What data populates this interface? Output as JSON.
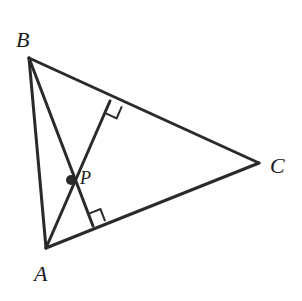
{
  "figure": {
    "type": "geometry-diagram",
    "background_color": "#ffffff",
    "stroke_color": "#2a2a2a",
    "label_color": "#1a1a1a",
    "stroke_width": 3,
    "vertices": [
      {
        "name": "A",
        "label": "A",
        "x": 46,
        "y": 248,
        "label_x": 34,
        "label_y": 281
      },
      {
        "name": "B",
        "label": "B",
        "x": 29,
        "y": 58,
        "label_x": 16,
        "label_y": 47
      },
      {
        "name": "C",
        "label": "C",
        "x": 259,
        "y": 163,
        "label_x": 270,
        "label_y": 173
      }
    ],
    "interior_point": {
      "name": "P",
      "label": "P",
      "x": 71,
      "y": 180,
      "dot_radius": 5,
      "label_x": 80,
      "label_y": 184
    },
    "sides": [
      {
        "name": "AB",
        "from": "A",
        "to": "B",
        "x1": 46,
        "y1": 248,
        "x2": 29,
        "y2": 58
      },
      {
        "name": "BC",
        "from": "B",
        "to": "C",
        "x1": 29,
        "y1": 58,
        "x2": 259,
        "y2": 163
      },
      {
        "name": "AC",
        "from": "A",
        "to": "C",
        "x1": 46,
        "y1": 248,
        "x2": 259,
        "y2": 163
      }
    ],
    "cevians": [
      {
        "name": "A-to-BC",
        "from": "A",
        "foot_on": "BC",
        "x1": 46,
        "y1": 248,
        "x2": 110,
        "y2": 101,
        "perpendicular": true
      },
      {
        "name": "B-to-AC",
        "from": "B",
        "foot_on": "AC",
        "x1": 29,
        "y1": 58,
        "x2": 93,
        "y2": 226,
        "perpendicular": true
      }
    ],
    "right_angle_marks": [
      {
        "name": "right-angle-on-BC",
        "at_side": "BC",
        "vertex_x": 110,
        "vertex_y": 101,
        "size": 13
      },
      {
        "name": "right-angle-on-AC",
        "at_side": "AC",
        "vertex_x": 93,
        "vertex_y": 226,
        "size": 13
      }
    ]
  }
}
